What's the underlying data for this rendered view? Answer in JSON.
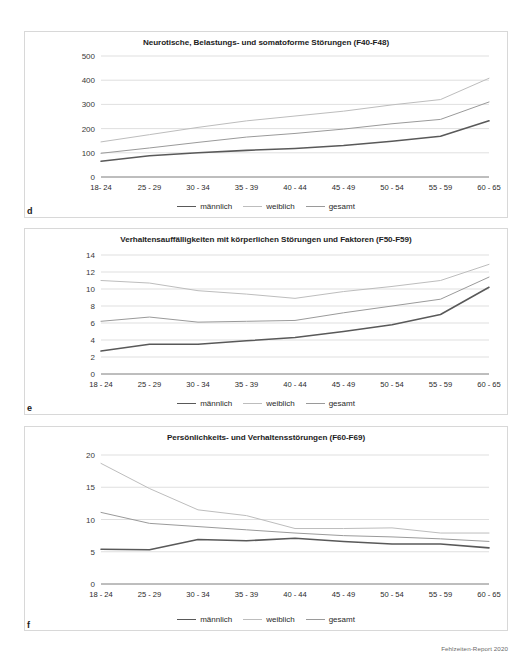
{
  "document": {
    "footer_note": "Fehlzeiten-Report 2020"
  },
  "legend": {
    "items": [
      {
        "label": "männlich",
        "key": "maennlich",
        "color": "#595959"
      },
      {
        "label": "weiblich",
        "key": "weiblich",
        "color": "#bdbdbd"
      },
      {
        "label": "gesamt",
        "key": "gesamt",
        "color": "#9a9a9a"
      }
    ]
  },
  "panels": [
    {
      "letter": "d",
      "chart_index": 0
    },
    {
      "letter": "e",
      "chart_index": 1
    },
    {
      "letter": "f",
      "chart_index": 2
    }
  ],
  "chart_data": [
    {
      "type": "line",
      "title": "Neurotische, Belastungs- und somatoforme Störungen (F40-F48)",
      "xlabel": "",
      "ylabel": "",
      "categories": [
        "18- 24",
        "25 - 29",
        "30 - 34",
        "35 - 39",
        "40 - 44",
        "45 - 49",
        "50 - 54",
        "55 - 59",
        "60 - 65"
      ],
      "yticks": [
        0,
        100,
        200,
        300,
        400,
        500
      ],
      "ylim": [
        0,
        500
      ],
      "grid": true,
      "legend_position": "bottom",
      "series": [
        {
          "name": "männlich",
          "values": [
            65,
            88,
            100,
            110,
            118,
            130,
            148,
            168,
            232
          ]
        },
        {
          "name": "weiblich",
          "values": [
            145,
            175,
            205,
            232,
            252,
            272,
            298,
            320,
            408
          ]
        },
        {
          "name": "gesamt",
          "values": [
            98,
            120,
            143,
            165,
            180,
            198,
            220,
            238,
            310
          ]
        }
      ]
    },
    {
      "type": "line",
      "title": "Verhaltensauffälligkeiten mit körperlichen Störungen und Faktoren (F50-F59)",
      "xlabel": "",
      "ylabel": "",
      "categories": [
        "18 - 24",
        "25 - 29",
        "30 - 34",
        "35 - 39",
        "40 - 44",
        "45 - 49",
        "50 - 54",
        "55 - 59",
        "60 - 65"
      ],
      "yticks": [
        0,
        2,
        4,
        6,
        8,
        10,
        12,
        14
      ],
      "ylim": [
        0,
        14
      ],
      "grid": true,
      "legend_position": "bottom",
      "series": [
        {
          "name": "männlich",
          "values": [
            2.7,
            3.5,
            3.5,
            3.9,
            4.3,
            5.0,
            5.8,
            7.0,
            10.2
          ]
        },
        {
          "name": "weiblich",
          "values": [
            11.0,
            10.7,
            9.8,
            9.4,
            8.9,
            9.7,
            10.3,
            11.0,
            12.9
          ]
        },
        {
          "name": "gesamt",
          "values": [
            6.2,
            6.7,
            6.1,
            6.2,
            6.3,
            7.2,
            8.0,
            8.8,
            11.4
          ]
        }
      ]
    },
    {
      "type": "line",
      "title": "Persönlichkeits- und Verhaltensstörungen (F60-F69)",
      "xlabel": "",
      "ylabel": "",
      "categories": [
        "18 - 24",
        "25 - 29",
        "30 - 34",
        "35 - 39",
        "40 - 44",
        "45 - 49",
        "50 - 54",
        "55 - 59",
        "60 - 65"
      ],
      "yticks": [
        0,
        5,
        10,
        15,
        20
      ],
      "ylim": [
        0,
        20
      ],
      "grid": true,
      "legend_position": "bottom",
      "series": [
        {
          "name": "männlich",
          "values": [
            5.4,
            5.3,
            6.9,
            6.7,
            7.1,
            6.6,
            6.2,
            6.2,
            5.6
          ]
        },
        {
          "name": "weiblich",
          "values": [
            18.7,
            14.8,
            11.5,
            10.6,
            8.6,
            8.6,
            8.7,
            7.9,
            7.9
          ]
        },
        {
          "name": "gesamt",
          "values": [
            11.1,
            9.4,
            8.9,
            8.4,
            7.9,
            7.5,
            7.3,
            7.0,
            6.6
          ]
        }
      ]
    }
  ]
}
